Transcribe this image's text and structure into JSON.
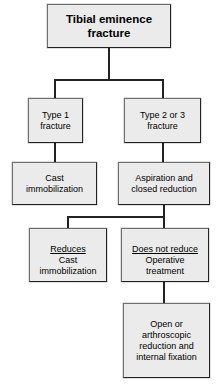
{
  "diagram": {
    "type": "flowchart",
    "colors": {
      "node_fill": "#ebebeb",
      "node_border": "#222222",
      "connector": "#222222",
      "text": "#000000",
      "background": "#ffffff"
    },
    "nodes": [
      {
        "id": "root",
        "data_name": "node-tibial-eminence-fracture",
        "text": "Tibial eminence\nfracture",
        "bold": true
      },
      {
        "id": "type1",
        "data_name": "node-type-1-fracture",
        "text": "Type 1\nfracture",
        "bold": false
      },
      {
        "id": "type23",
        "data_name": "node-type-2-or-3-fracture",
        "text": "Type 2 or 3\nfracture",
        "bold": false
      },
      {
        "id": "cast1",
        "data_name": "node-cast-immobilization",
        "text": "Cast\nimmobilization",
        "bold": false
      },
      {
        "id": "aspiration",
        "data_name": "node-aspiration-closed-reduction",
        "text": "Aspiration and\nclosed reduction",
        "bold": false
      },
      {
        "id": "reduces",
        "data_name": "node-reduces-cast-immobilization",
        "label": "Reduces",
        "text": "Cast\nimmobilization",
        "bold": false
      },
      {
        "id": "not_reduce",
        "data_name": "node-does-not-reduce-operative",
        "label": "Does not reduce",
        "text": "Operative\ntreatment",
        "bold": false
      },
      {
        "id": "orif",
        "data_name": "node-open-arthroscopic-reduction",
        "text": "Open or\narthroscopic\nreduction and\ninternal fixation",
        "bold": false
      }
    ],
    "edges": [
      {
        "from": "root",
        "to": "type1"
      },
      {
        "from": "root",
        "to": "type23"
      },
      {
        "from": "type1",
        "to": "cast1"
      },
      {
        "from": "type23",
        "to": "aspiration"
      },
      {
        "from": "aspiration",
        "to": "reduces"
      },
      {
        "from": "aspiration",
        "to": "not_reduce"
      },
      {
        "from": "not_reduce",
        "to": "orif"
      }
    ]
  }
}
